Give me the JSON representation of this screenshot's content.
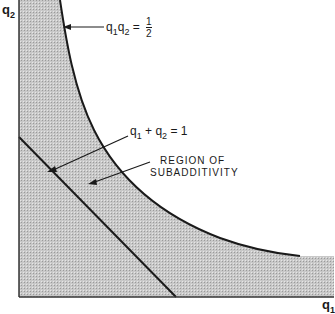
{
  "diagram": {
    "type": "region-plot",
    "axes": {
      "x_label": "q",
      "x_sub": "1",
      "y_label": "q",
      "y_sub": "2"
    },
    "curves": [
      {
        "name": "hyperbola",
        "label_var1": "q",
        "label_sub1": "1",
        "label_var2": "q",
        "label_sub2": "2",
        "label_eq": "=",
        "frac_num": "1",
        "frac_den": "2"
      },
      {
        "name": "line",
        "label_var1": "q",
        "label_sub1": "1",
        "label_plus": "+",
        "label_var2": "q",
        "label_sub2": "2",
        "label_eq": "= 1"
      }
    ],
    "region_label_line1": "REGION OF",
    "region_label_line2": "SUBADDITIVITY",
    "colors": {
      "shade": "#bdbdbd",
      "line": "#1a1a1a",
      "background": "#ffffff"
    }
  }
}
